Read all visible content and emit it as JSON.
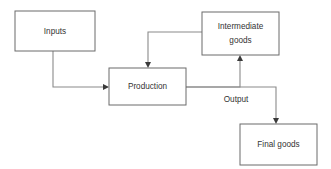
{
  "diagram": {
    "background_color": "#ffffff",
    "box_stroke_color": "#6b6b6b",
    "line_color": "#8a8a8a",
    "arrow_color": "#3a3a3a",
    "text_color": "#333333",
    "nodes": [
      {
        "id": "inputs",
        "label": "Inputs",
        "label_line1": "Inputs",
        "label_line2": "",
        "x": 15,
        "y": 11,
        "width": 80,
        "height": 40
      },
      {
        "id": "production",
        "label": "Production",
        "label_line1": "Production",
        "label_line2": "",
        "x": 109,
        "y": 68,
        "width": 77,
        "height": 37
      },
      {
        "id": "intermediate_goods",
        "label": "Intermediate goods",
        "label_line1": "Intermediate",
        "label_line2": "goods",
        "x": 202,
        "y": 12,
        "width": 77,
        "height": 43
      },
      {
        "id": "final_goods",
        "label": "Final goods",
        "label_line1": "Final goods",
        "label_line2": "",
        "x": 240,
        "y": 124,
        "width": 77,
        "height": 41
      }
    ],
    "edges": [
      {
        "id": "inputs-to-production",
        "from": "inputs",
        "to": "production",
        "label": "",
        "path": "M 53 51 L 53 87 L 104 87",
        "arrow": "right",
        "arrow_x": 109,
        "arrow_y": 87
      },
      {
        "id": "intermediate-to-production",
        "from": "intermediate_goods",
        "to": "production",
        "label": "",
        "path": "M 202 32 L 148 32 L 148 63",
        "arrow": "down",
        "arrow_x": 148,
        "arrow_y": 68
      },
      {
        "id": "production-to-intermediate",
        "from": "production",
        "to": "intermediate_goods",
        "label": "",
        "path": "M 186 87 L 240 87 L 240 60",
        "arrow": "up",
        "arrow_x": 240,
        "arrow_y": 55
      },
      {
        "id": "production-to-final-goods",
        "from": "production",
        "to": "final_goods",
        "label": "Output",
        "path": "M 186 87 L 276 87 L 276 119",
        "arrow": "down",
        "arrow_x": 276,
        "arrow_y": 124,
        "label_x": 236,
        "label_y": 100
      }
    ]
  }
}
